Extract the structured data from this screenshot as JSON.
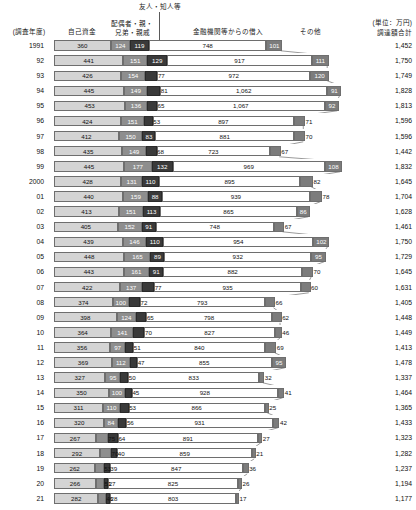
{
  "header": {
    "friends_label": "友人・知人等",
    "year_label": "(調査年度)",
    "self_label": "自己資金",
    "relatives_label": "配偶者・親・\n兄弟・親戚",
    "relatives_line1": "配偶者・親・",
    "relatives_line2": "兄弟・親戚",
    "bank_label": "金融機関等からの借入",
    "other_label": "その他",
    "unit_label": "(単位：万円)",
    "total_label": "調達額合計"
  },
  "colors": {
    "self": "#d4d4d4",
    "relatives": "#8e8e8e",
    "friends": "#3a3a3a",
    "bank": "#ffffff",
    "other": "#7c7c7c",
    "border": "#6e6e6e",
    "text": "#111111"
  },
  "chart_data": {
    "type": "bar",
    "orientation": "horizontal",
    "stacked": true,
    "xlabel": "",
    "ylabel": "(調査年度)",
    "unit": "万円",
    "legend": [
      "自己資金",
      "配偶者・親・兄弟・親戚",
      "友人・知人等",
      "金融機関等からの借入",
      "その他"
    ],
    "legend_position": "top",
    "grid": false,
    "categories": [
      "1991",
      "92",
      "93",
      "94",
      "95",
      "96",
      "97",
      "98",
      "99",
      "2000",
      "01",
      "02",
      "03",
      "04",
      "05",
      "06",
      "07",
      "08",
      "09",
      "10",
      "11",
      "12",
      "13",
      "14",
      "15",
      "16",
      "17",
      "18",
      "19",
      "20",
      "21"
    ],
    "series": [
      {
        "name": "自己資金",
        "values": [
          360,
          441,
          426,
          445,
          453,
          424,
          412,
          435,
          445,
          428,
          440,
          413,
          405,
          439,
          448,
          443,
          422,
          374,
          398,
          364,
          356,
          369,
          327,
          350,
          311,
          320,
          267,
          292,
          262,
          266,
          282
        ]
      },
      {
        "name": "配偶者・親・兄弟・親戚",
        "values": [
          124,
          151,
          154,
          149,
          136,
          151,
          150,
          149,
          177,
          131,
          159,
          151,
          152,
          146,
          165,
          161,
          137,
          100,
          124,
          141,
          97,
          112,
          95,
          100,
          110,
          84,
          75,
          70,
          53,
          51,
          46
        ]
      },
      {
        "name": "友人・知人等",
        "values": [
          119,
          129,
          77,
          81,
          65,
          53,
          83,
          68,
          132,
          110,
          88,
          113,
          91,
          110,
          89,
          91,
          77,
          72,
          65,
          70,
          51,
          47,
          50,
          45,
          53,
          56,
          64,
          40,
          39,
          27,
          28
        ]
      },
      {
        "name": "金融機関等からの借入",
        "values": [
          748,
          917,
          972,
          1062,
          1067,
          897,
          881,
          723,
          969,
          895,
          939,
          865,
          748,
          954,
          932,
          882,
          935,
          793,
          798,
          827,
          840,
          855,
          833,
          928,
          866,
          931,
          891,
          859,
          847,
          825,
          803
        ]
      },
      {
        "name": "その他",
        "values": [
          101,
          111,
          120,
          91,
          92,
          71,
          70,
          67,
          108,
          82,
          78,
          86,
          67,
          102,
          95,
          70,
          60,
          66,
          62,
          46,
          69,
          95,
          32,
          41,
          25,
          42,
          27,
          21,
          36,
          26,
          17
        ]
      }
    ],
    "totals": [
      1452,
      1750,
      1749,
      1828,
      1813,
      1596,
      1596,
      1442,
      1832,
      1645,
      1704,
      1628,
      1461,
      1750,
      1729,
      1645,
      1631,
      1405,
      1448,
      1449,
      1413,
      1478,
      1337,
      1464,
      1365,
      1433,
      1323,
      1282,
      1237,
      1194,
      1177
    ]
  },
  "rows": [
    {
      "year": "1991",
      "values": [
        360,
        124,
        119,
        748,
        101
      ],
      "total": "1,452"
    },
    {
      "year": "92",
      "values": [
        441,
        151,
        129,
        917,
        111
      ],
      "total": "1,750"
    },
    {
      "year": "93",
      "values": [
        426,
        154,
        77,
        972,
        120
      ],
      "total": "1,749"
    },
    {
      "year": "94",
      "values": [
        445,
        149,
        81,
        1062,
        91
      ],
      "total": "1,828"
    },
    {
      "year": "95",
      "values": [
        453,
        136,
        65,
        1067,
        92
      ],
      "total": "1,813"
    },
    {
      "year": "96",
      "values": [
        424,
        151,
        53,
        897,
        71
      ],
      "total": "1,596"
    },
    {
      "year": "97",
      "values": [
        412,
        150,
        83,
        881,
        70
      ],
      "total": "1,596"
    },
    {
      "year": "98",
      "values": [
        435,
        149,
        68,
        723,
        67
      ],
      "total": "1,442"
    },
    {
      "year": "99",
      "values": [
        445,
        177,
        132,
        969,
        108
      ],
      "total": "1,832"
    },
    {
      "year": "2000",
      "values": [
        428,
        131,
        110,
        895,
        82
      ],
      "total": "1,645"
    },
    {
      "year": "01",
      "values": [
        440,
        159,
        88,
        939,
        78
      ],
      "total": "1,704"
    },
    {
      "year": "02",
      "values": [
        413,
        151,
        113,
        865,
        86
      ],
      "total": "1,628"
    },
    {
      "year": "03",
      "values": [
        405,
        152,
        91,
        748,
        67
      ],
      "total": "1,461"
    },
    {
      "year": "04",
      "values": [
        439,
        146,
        110,
        954,
        102
      ],
      "total": "1,750"
    },
    {
      "year": "05",
      "values": [
        448,
        165,
        89,
        932,
        95
      ],
      "total": "1,729"
    },
    {
      "year": "06",
      "values": [
        443,
        161,
        91,
        882,
        70
      ],
      "total": "1,645"
    },
    {
      "year": "07",
      "values": [
        422,
        137,
        77,
        935,
        60
      ],
      "total": "1,631"
    },
    {
      "year": "08",
      "values": [
        374,
        100,
        72,
        793,
        66
      ],
      "total": "1,405"
    },
    {
      "year": "09",
      "values": [
        398,
        124,
        65,
        798,
        62
      ],
      "total": "1,448"
    },
    {
      "year": "10",
      "values": [
        364,
        141,
        70,
        827,
        46
      ],
      "total": "1,449"
    },
    {
      "year": "11",
      "values": [
        356,
        97,
        51,
        840,
        69
      ],
      "total": "1,413"
    },
    {
      "year": "12",
      "values": [
        369,
        112,
        47,
        855,
        95
      ],
      "total": "1,478"
    },
    {
      "year": "13",
      "values": [
        327,
        95,
        50,
        833,
        32
      ],
      "total": "1,337"
    },
    {
      "year": "14",
      "values": [
        350,
        100,
        45,
        928,
        41
      ],
      "total": "1,464"
    },
    {
      "year": "15",
      "values": [
        311,
        110,
        53,
        866,
        25
      ],
      "total": "1,365"
    },
    {
      "year": "16",
      "values": [
        320,
        84,
        56,
        931,
        42
      ],
      "total": "1,433"
    },
    {
      "year": "17",
      "values": [
        267,
        75,
        64,
        891,
        27
      ],
      "total": "1,323"
    },
    {
      "year": "18",
      "values": [
        292,
        70,
        40,
        859,
        21
      ],
      "total": "1,282"
    },
    {
      "year": "19",
      "values": [
        262,
        53,
        39,
        847,
        36
      ],
      "total": "1,237"
    },
    {
      "year": "20",
      "values": [
        266,
        51,
        27,
        825,
        26
      ],
      "total": "1,194"
    },
    {
      "year": "21",
      "values": [
        282,
        46,
        28,
        803,
        17
      ],
      "total": "1,177"
    }
  ]
}
